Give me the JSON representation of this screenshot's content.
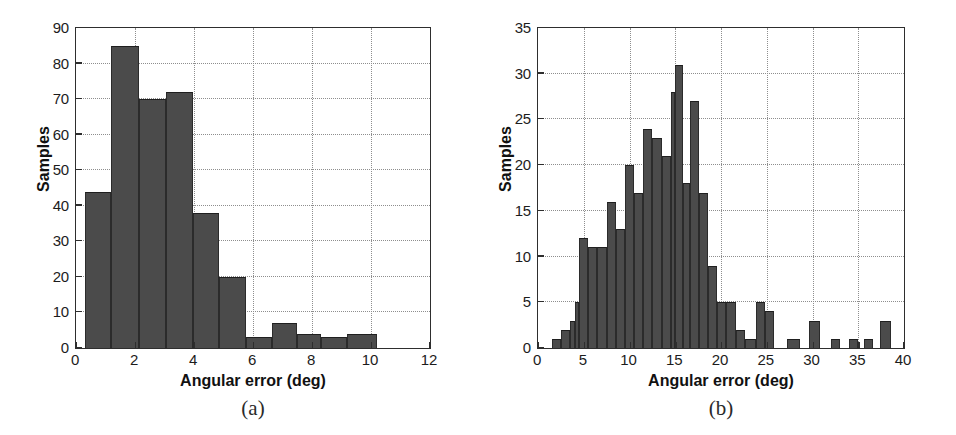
{
  "figure": {
    "background_color": "#ffffff",
    "bar_color": "#4b4b4b",
    "axis_color": "#2e2e2e",
    "grid_color": "#8e8e8e"
  },
  "chart_data": [
    {
      "type": "bar",
      "subcaption": "(a)",
      "title": "",
      "xlabel": "Angular error (deg)",
      "ylabel": "Samples",
      "xlim": [
        0,
        12
      ],
      "ylim": [
        0,
        90
      ],
      "xticks": [
        0,
        2,
        4,
        6,
        8,
        10,
        12
      ],
      "xtick_labels": [
        "0",
        "2",
        "4",
        "6",
        "8",
        "10",
        "12"
      ],
      "yticks": [
        0,
        10,
        20,
        30,
        40,
        50,
        60,
        70,
        80,
        90
      ],
      "ytick_labels": [
        "0",
        "10",
        "20",
        "30",
        "40",
        "50",
        "60",
        "70",
        "80",
        "90"
      ],
      "grid": true,
      "bin_edges": [
        0.3,
        1.2,
        2.15,
        3.05,
        3.95,
        4.85,
        5.75,
        6.65,
        7.5,
        8.3,
        9.2,
        10.2
      ],
      "values": [
        44,
        85,
        70,
        72,
        38,
        20,
        3,
        7,
        4,
        3,
        4
      ],
      "bins": [
        {
          "x0": 0.3,
          "x1": 1.2,
          "count": 44
        },
        {
          "x0": 1.2,
          "x1": 2.15,
          "count": 85
        },
        {
          "x0": 2.15,
          "x1": 3.05,
          "count": 70
        },
        {
          "x0": 3.05,
          "x1": 3.95,
          "count": 72
        },
        {
          "x0": 3.95,
          "x1": 4.85,
          "count": 38
        },
        {
          "x0": 4.85,
          "x1": 5.75,
          "count": 20
        },
        {
          "x0": 5.75,
          "x1": 6.65,
          "count": 3
        },
        {
          "x0": 6.65,
          "x1": 7.5,
          "count": 7
        },
        {
          "x0": 7.5,
          "x1": 8.3,
          "count": 4
        },
        {
          "x0": 8.3,
          "x1": 9.2,
          "count": 3
        },
        {
          "x0": 9.2,
          "x1": 10.2,
          "count": 4
        }
      ]
    },
    {
      "type": "bar",
      "subcaption": "(b)",
      "title": "",
      "xlabel": "Angular error (deg)",
      "ylabel": "Samples",
      "xlim": [
        0,
        40
      ],
      "ylim": [
        0,
        35
      ],
      "xticks": [
        0,
        5,
        10,
        15,
        20,
        25,
        30,
        35,
        40
      ],
      "xtick_labels": [
        "0",
        "5",
        "10",
        "15",
        "20",
        "25",
        "30",
        "35",
        "40"
      ],
      "yticks": [
        0,
        5,
        10,
        15,
        20,
        25,
        30,
        35
      ],
      "ytick_labels": [
        "0",
        "5",
        "10",
        "15",
        "20",
        "25",
        "30",
        "35"
      ],
      "grid": true,
      "bin_width": 1.0,
      "bin_start": 1.5,
      "values": [
        1,
        2,
        3,
        5,
        12,
        11,
        11,
        16,
        13,
        20,
        17,
        24,
        23,
        21,
        28,
        31,
        18,
        27,
        17,
        9,
        5,
        5,
        2,
        1,
        5,
        4,
        0,
        1,
        0,
        3,
        0,
        1,
        0,
        1,
        1,
        0,
        3
      ],
      "bins": [
        {
          "x0": 1.5,
          "x1": 2.5,
          "count": 1
        },
        {
          "x0": 2.5,
          "x1": 3.5,
          "count": 2
        },
        {
          "x0": 3.5,
          "x1": 4.0,
          "count": 3
        },
        {
          "x0": 4.0,
          "x1": 4.5,
          "count": 5
        },
        {
          "x0": 4.5,
          "x1": 5.5,
          "count": 12
        },
        {
          "x0": 5.5,
          "x1": 6.5,
          "count": 11
        },
        {
          "x0": 6.5,
          "x1": 7.5,
          "count": 11
        },
        {
          "x0": 7.5,
          "x1": 8.5,
          "count": 16
        },
        {
          "x0": 8.5,
          "x1": 9.5,
          "count": 13
        },
        {
          "x0": 9.5,
          "x1": 10.5,
          "count": 20
        },
        {
          "x0": 10.5,
          "x1": 11.5,
          "count": 17
        },
        {
          "x0": 11.5,
          "x1": 12.5,
          "count": 24
        },
        {
          "x0": 12.5,
          "x1": 13.5,
          "count": 23
        },
        {
          "x0": 13.5,
          "x1": 14.5,
          "count": 21
        },
        {
          "x0": 14.5,
          "x1": 15.0,
          "count": 28
        },
        {
          "x0": 15.0,
          "x1": 15.8,
          "count": 31
        },
        {
          "x0": 15.8,
          "x1": 16.6,
          "count": 18
        },
        {
          "x0": 16.6,
          "x1": 17.6,
          "count": 27
        },
        {
          "x0": 17.6,
          "x1": 18.6,
          "count": 17
        },
        {
          "x0": 18.6,
          "x1": 19.6,
          "count": 9
        },
        {
          "x0": 19.6,
          "x1": 20.6,
          "count": 5
        },
        {
          "x0": 20.6,
          "x1": 21.6,
          "count": 5
        },
        {
          "x0": 21.6,
          "x1": 22.6,
          "count": 2
        },
        {
          "x0": 22.6,
          "x1": 23.8,
          "count": 1
        },
        {
          "x0": 23.8,
          "x1": 24.8,
          "count": 5
        },
        {
          "x0": 24.8,
          "x1": 25.8,
          "count": 4
        },
        {
          "x0": 27.2,
          "x1": 28.6,
          "count": 1
        },
        {
          "x0": 29.6,
          "x1": 30.8,
          "count": 3
        },
        {
          "x0": 32.0,
          "x1": 33.0,
          "count": 1
        },
        {
          "x0": 34.0,
          "x1": 35.0,
          "count": 1
        },
        {
          "x0": 35.6,
          "x1": 36.6,
          "count": 1
        },
        {
          "x0": 37.4,
          "x1": 38.6,
          "count": 3
        }
      ]
    }
  ]
}
